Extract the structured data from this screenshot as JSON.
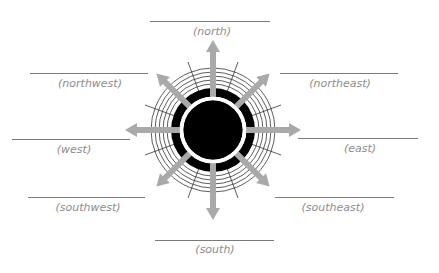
{
  "diagram": {
    "center": {
      "x": 213,
      "y": 130
    },
    "colors": {
      "arrow": "#a9a9a9",
      "core": "#000000",
      "ring_line": "#333333",
      "label": "#8c8c8c",
      "blank_line": "#7a7a7a"
    },
    "directions": [
      {
        "key": "north",
        "label": "(north)",
        "line": {
          "x1": 150,
          "x2": 270,
          "y": 21
        },
        "text": {
          "x": 212,
          "y": 26
        }
      },
      {
        "key": "northwest",
        "label": "(northwest)",
        "line": {
          "x1": 30,
          "x2": 148,
          "y": 73
        },
        "text": {
          "x": 90,
          "y": 78
        }
      },
      {
        "key": "northeast",
        "label": "(northeast)",
        "line": {
          "x1": 280,
          "x2": 398,
          "y": 73
        },
        "text": {
          "x": 340,
          "y": 78
        }
      },
      {
        "key": "west",
        "label": "(west)",
        "line": {
          "x1": 12,
          "x2": 130,
          "y": 139
        },
        "text": {
          "x": 74,
          "y": 143
        }
      },
      {
        "key": "east",
        "label": "(east)",
        "line": {
          "x1": 298,
          "x2": 418,
          "y": 138
        },
        "text": {
          "x": 360,
          "y": 142
        }
      },
      {
        "key": "southwest",
        "label": "(southwest)",
        "line": {
          "x1": 28,
          "x2": 145,
          "y": 197
        },
        "text": {
          "x": 88,
          "y": 202
        }
      },
      {
        "key": "southeast",
        "label": "(southeast)",
        "line": {
          "x1": 275,
          "x2": 394,
          "y": 197
        },
        "text": {
          "x": 333,
          "y": 202
        }
      },
      {
        "key": "south",
        "label": "(south)",
        "line": {
          "x1": 155,
          "x2": 274,
          "y": 240
        },
        "text": {
          "x": 215,
          "y": 244
        }
      }
    ]
  }
}
